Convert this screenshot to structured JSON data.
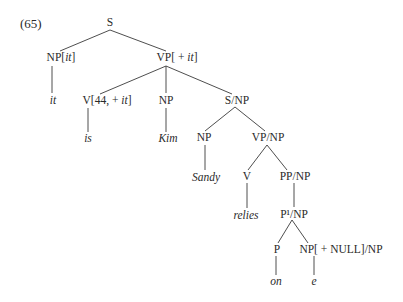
{
  "example_number": "(65)",
  "nodes": {
    "s": {
      "label": "S"
    },
    "np_it": {
      "base": "NP[",
      "feat": "it",
      "close": "]"
    },
    "vp_it": {
      "base": "VP[ + ",
      "feat": "it",
      "close": "]"
    },
    "it_word": {
      "label": "it"
    },
    "v44": {
      "base": "V[44,  + ",
      "feat": "it",
      "close": "]"
    },
    "np_kim": {
      "label": "NP"
    },
    "s_np": {
      "label": "S/NP"
    },
    "is_word": {
      "label": "is"
    },
    "kim_word": {
      "label": "Kim"
    },
    "np_sandy": {
      "label": "NP"
    },
    "vp_np": {
      "label": "VP/NP"
    },
    "sandy_word": {
      "label": "Sandy"
    },
    "v": {
      "label": "V"
    },
    "pp_np": {
      "label": "PP/NP"
    },
    "relies_word": {
      "label": "relies"
    },
    "pbar_np": {
      "label": "P¹/NP"
    },
    "p": {
      "label": "P"
    },
    "np_null": {
      "label": "NP[ + NULL]/NP"
    },
    "on_word": {
      "label": "on"
    },
    "e_word": {
      "label": "e"
    }
  }
}
